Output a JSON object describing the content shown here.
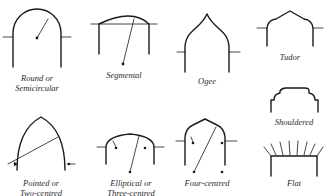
{
  "figure": {
    "arches": [
      {
        "id": "round",
        "label_line1": "Round or",
        "label_line2": "Semicircular"
      },
      {
        "id": "segmental",
        "label_line1": "Segmental",
        "label_line2": ""
      },
      {
        "id": "ogee",
        "label_line1": "Ogee",
        "label_line2": ""
      },
      {
        "id": "tudor",
        "label_line1": "Tudor",
        "label_line2": ""
      },
      {
        "id": "shouldered",
        "label_line1": "Shouldered",
        "label_line2": ""
      },
      {
        "id": "pointed",
        "label_line1": "Pointed or",
        "label_line2": "Two-centred"
      },
      {
        "id": "elliptical",
        "label_line1": "Elliptical or",
        "label_line2": "Three-centred"
      },
      {
        "id": "four-centred",
        "label_line1": "Four-centred",
        "label_line2": ""
      },
      {
        "id": "flat",
        "label_line1": "Flat",
        "label_line2": ""
      }
    ]
  },
  "colors": {
    "ink": "#1a1a1a",
    "paper": "#ffffff"
  }
}
